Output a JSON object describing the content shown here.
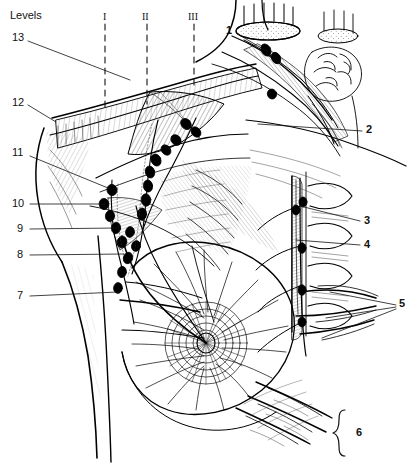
{
  "figure": {
    "heading": "Levels",
    "background": "#ffffff",
    "ink": "#000000",
    "width": 420,
    "height": 464
  },
  "levels": [
    {
      "numeral": "I",
      "x": 105,
      "y": 15,
      "line_x": 105,
      "line_y1": 24,
      "line_y2": 112
    },
    {
      "numeral": "II",
      "x": 144,
      "y": 15,
      "line_x": 147,
      "line_y1": 24,
      "line_y2": 104
    },
    {
      "numeral": "III",
      "x": 190,
      "y": 15,
      "line_x": 194,
      "line_y1": 24,
      "line_y2": 90
    }
  ],
  "callouts": [
    {
      "id": "1",
      "x": 226,
      "y": 31,
      "side": "right-inner"
    },
    {
      "id": "2",
      "x": 368,
      "y": 129,
      "side": "right"
    },
    {
      "id": "3",
      "x": 366,
      "y": 221,
      "side": "right"
    },
    {
      "id": "4",
      "x": 366,
      "y": 245,
      "side": "right"
    },
    {
      "id": "5",
      "x": 401,
      "y": 305,
      "side": "right"
    },
    {
      "id": "6",
      "x": 360,
      "y": 438,
      "side": "right"
    },
    {
      "id": "7",
      "x": 17,
      "y": 296,
      "side": "left"
    },
    {
      "id": "8",
      "x": 17,
      "y": 255,
      "side": "left"
    },
    {
      "id": "9",
      "x": 17,
      "y": 229,
      "side": "left"
    },
    {
      "id": "10",
      "x": 14,
      "y": 204,
      "side": "left"
    },
    {
      "id": "11",
      "x": 14,
      "y": 153,
      "side": "left"
    },
    {
      "id": "12",
      "x": 14,
      "y": 103,
      "side": "left"
    },
    {
      "id": "13",
      "x": 14,
      "y": 38,
      "side": "left"
    }
  ],
  "braces": [
    {
      "for": "6",
      "x": 341,
      "y_top": 410,
      "y_bottom": 456
    }
  ]
}
